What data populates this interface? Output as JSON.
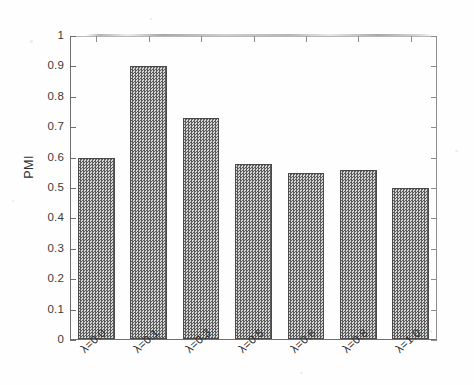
{
  "chart_data": {
    "type": "bar",
    "title": "",
    "xlabel": "",
    "ylabel": "PMI",
    "categories": [
      "λ=0.0",
      "λ=0.1",
      "λ=0.3",
      "λ=0.5",
      "λ=0.6",
      "λ=0.8",
      "λ=1.0"
    ],
    "values": [
      0.6,
      0.9,
      0.73,
      0.58,
      0.55,
      0.56,
      0.5
    ],
    "ylim": [
      0,
      1
    ],
    "ytick_labels": [
      "0",
      "0.1",
      "0.2",
      "0.3",
      "0.4",
      "0.5",
      "0.6",
      "0.7",
      "0.8",
      "0.9",
      "1"
    ],
    "ytick_values": [
      0,
      0.1,
      0.2,
      0.3,
      0.4,
      0.5,
      0.6,
      0.7,
      0.8,
      0.9,
      1
    ],
    "grid": false,
    "legend": null,
    "bar_fill": "#8a8a8a",
    "bar_edge": "#4a4a4a",
    "axis_color": "#6e6e6e",
    "background": "#fefefe"
  },
  "figure": {
    "y_axis_title": "PMI"
  }
}
